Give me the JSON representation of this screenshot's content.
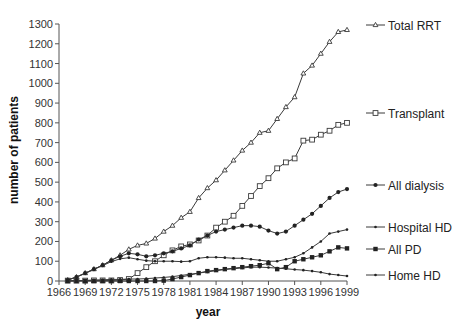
{
  "chart_data": {
    "type": "line",
    "title": "",
    "xlabel": "year",
    "ylabel": "number of patients",
    "xlim": [
      1966,
      1999
    ],
    "ylim": [
      0,
      1300
    ],
    "grid": false,
    "legend_position": "right (inline labels at line ends)",
    "x_ticks": [
      "1966",
      "1969",
      "1972",
      "1975",
      "1978",
      "1981",
      "1984",
      "1987",
      "1990",
      "1993",
      "1996",
      "1999"
    ],
    "y_ticks": [
      "0",
      "100",
      "200",
      "300",
      "400",
      "500",
      "600",
      "700",
      "800",
      "900",
      "1000",
      "1100",
      "1200",
      "1300"
    ],
    "x": [
      1967,
      1968,
      1969,
      1970,
      1971,
      1972,
      1973,
      1974,
      1975,
      1976,
      1977,
      1978,
      1979,
      1980,
      1981,
      1982,
      1983,
      1984,
      1985,
      1986,
      1987,
      1988,
      1989,
      1990,
      1991,
      1992,
      1993,
      1994,
      1995,
      1996,
      1997,
      1998,
      1999
    ],
    "series": [
      {
        "name": "Total RRT",
        "marker": "triangle",
        "values": [
          5,
          20,
          40,
          60,
          80,
          105,
          130,
          160,
          180,
          190,
          215,
          250,
          280,
          320,
          350,
          420,
          470,
          510,
          560,
          610,
          660,
          700,
          750,
          760,
          820,
          880,
          930,
          1050,
          1090,
          1150,
          1210,
          1260,
          1270
        ]
      },
      {
        "name": "Transplant",
        "marker": "open-square",
        "values": [
          2,
          2,
          2,
          3,
          3,
          3,
          5,
          10,
          40,
          70,
          100,
          130,
          155,
          175,
          185,
          205,
          230,
          270,
          300,
          330,
          380,
          430,
          480,
          520,
          570,
          600,
          620,
          710,
          715,
          740,
          760,
          790,
          800
        ]
      },
      {
        "name": "All dialysis",
        "marker": "filled-circle",
        "values": [
          5,
          20,
          40,
          60,
          80,
          105,
          125,
          140,
          135,
          125,
          130,
          140,
          150,
          165,
          180,
          210,
          230,
          250,
          260,
          270,
          280,
          280,
          275,
          255,
          240,
          250,
          280,
          310,
          340,
          380,
          420,
          450,
          465
        ]
      },
      {
        "name": "Hospital HD",
        "marker": "small-dot",
        "values": [
          5,
          20,
          38,
          58,
          78,
          98,
          112,
          118,
          110,
          103,
          100,
          100,
          100,
          98,
          100,
          115,
          120,
          120,
          118,
          115,
          115,
          110,
          105,
          100,
          100,
          110,
          120,
          140,
          170,
          200,
          240,
          250,
          260
        ]
      },
      {
        "name": "All PD",
        "marker": "filled-square",
        "values": [
          0,
          0,
          0,
          0,
          0,
          0,
          0,
          0,
          0,
          0,
          0,
          2,
          10,
          20,
          30,
          40,
          50,
          55,
          60,
          65,
          70,
          75,
          80,
          90,
          60,
          70,
          100,
          110,
          120,
          130,
          150,
          170,
          165
        ]
      },
      {
        "name": "Home HD",
        "marker": "small-dot",
        "values": [
          0,
          1,
          3,
          5,
          6,
          8,
          8,
          10,
          10,
          12,
          15,
          18,
          22,
          28,
          34,
          40,
          46,
          52,
          58,
          62,
          66,
          70,
          70,
          68,
          65,
          62,
          58,
          55,
          50,
          44,
          35,
          30,
          25
        ]
      }
    ]
  },
  "axes": {
    "xlabel": "year",
    "ylabel": "number of patients"
  }
}
